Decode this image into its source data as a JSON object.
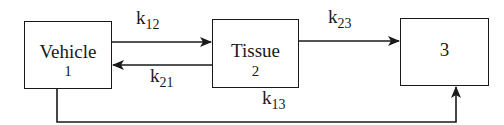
{
  "diagram": {
    "type": "compartment-model",
    "compartments": [
      {
        "id": "1",
        "label": "Vehicle",
        "number": "1"
      },
      {
        "id": "2",
        "label": "Tissue",
        "number": "2"
      },
      {
        "id": "3",
        "label": "",
        "number": "3"
      }
    ],
    "rates": {
      "k12": {
        "base": "k",
        "sub": "12",
        "from": "1",
        "to": "2"
      },
      "k21": {
        "base": "k",
        "sub": "21",
        "from": "2",
        "to": "1"
      },
      "k23": {
        "base": "k",
        "sub": "23",
        "from": "2",
        "to": "3"
      },
      "k13": {
        "base": "k",
        "sub": "13",
        "from": "1",
        "to": "3"
      }
    },
    "line_color": "#1a1a1a"
  }
}
